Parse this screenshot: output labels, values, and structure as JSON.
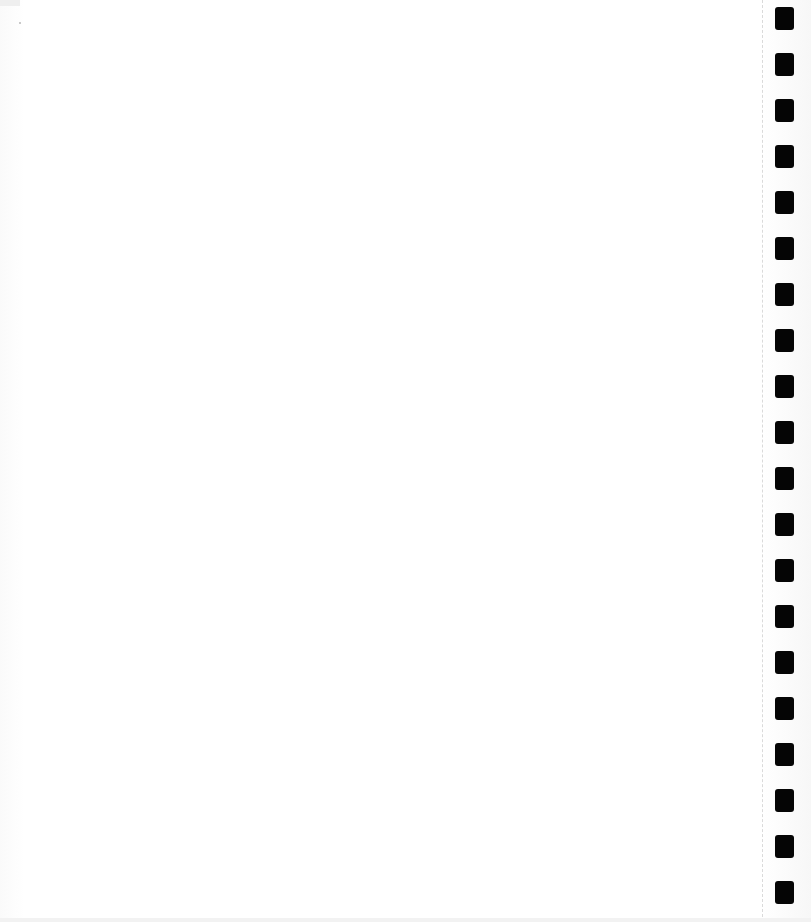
{
  "page": {
    "type": "blank scanned page",
    "background_color": "#ffffff",
    "text_content": ""
  },
  "binding_marks": {
    "count": 20,
    "color": "#050505",
    "tops": [
      7,
      53,
      99,
      145,
      191,
      237,
      283,
      329,
      375,
      421,
      467,
      513,
      559,
      605,
      651,
      697,
      743,
      789,
      835,
      881
    ]
  },
  "tear_line": {
    "x": 762,
    "style": "dashed",
    "color": "#dadada"
  }
}
